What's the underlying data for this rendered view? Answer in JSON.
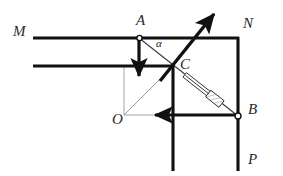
{
  "figure": {
    "background_color": "#ffffff",
    "stroke_color": "#1a1a1a",
    "thin_stroke_color": "#8c8c8c",
    "labels": {
      "M": "M",
      "N": "N",
      "A": "A",
      "B": "B",
      "C": "C",
      "O": "O",
      "P": "P",
      "alpha": "α"
    },
    "points": {
      "A": {
        "x": 139,
        "y": 38,
        "name": "pivot-a"
      },
      "B": {
        "x": 238,
        "y": 115,
        "name": "pivot-b"
      },
      "C": {
        "x": 173,
        "y": 66,
        "name": "joint-c"
      },
      "O": {
        "x": 124,
        "y": 115,
        "name": "corner-o"
      },
      "N_corner": {
        "x": 238,
        "y": 38
      },
      "M_start": {
        "x": 33,
        "y": 38
      },
      "second_rail_start": {
        "x": 33,
        "y": 66
      }
    },
    "elements": [
      {
        "name": "rail-m-top",
        "type": "thick-line",
        "from": [
          33,
          38
        ],
        "to": [
          238,
          38
        ]
      },
      {
        "name": "rail-m-lower",
        "type": "thick-line",
        "from": [
          33,
          66
        ],
        "to": [
          173,
          66
        ]
      },
      {
        "name": "vertical-rail-n",
        "type": "thick-line",
        "from": [
          238,
          38
        ],
        "to": [
          238,
          170
        ]
      },
      {
        "name": "vertical-rail-center",
        "type": "thick-line",
        "from": [
          173,
          66
        ],
        "to": [
          173,
          170
        ]
      },
      {
        "name": "arrow-down-at-a",
        "type": "thick-arrow",
        "from": [
          139,
          38
        ],
        "to": [
          139,
          80
        ]
      },
      {
        "name": "arrow-left-at-b",
        "type": "thick-arrow",
        "from": [
          238,
          115
        ],
        "to": [
          152,
          115
        ]
      },
      {
        "name": "arrow-up-right-at-c",
        "type": "thick-arrow",
        "from": [
          160,
          80
        ],
        "to": [
          215,
          12
        ]
      },
      {
        "name": "rod-ac",
        "type": "thin-line",
        "from": [
          139,
          38
        ],
        "to": [
          173,
          66
        ]
      },
      {
        "name": "triangle-oc",
        "type": "thin-line",
        "from": [
          124,
          115
        ],
        "to": [
          173,
          66
        ]
      },
      {
        "name": "thin-box",
        "type": "thin-rect",
        "from": [
          124,
          66
        ],
        "to": [
          173,
          115
        ]
      },
      {
        "name": "syringe-collar",
        "type": "hatched-rod",
        "from": [
          180,
          74
        ],
        "to": [
          234,
          116
        ]
      }
    ],
    "annotations": {
      "angle_alpha_at": "A",
      "angle_alpha_between": "line AC and horizontal rail M"
    }
  }
}
